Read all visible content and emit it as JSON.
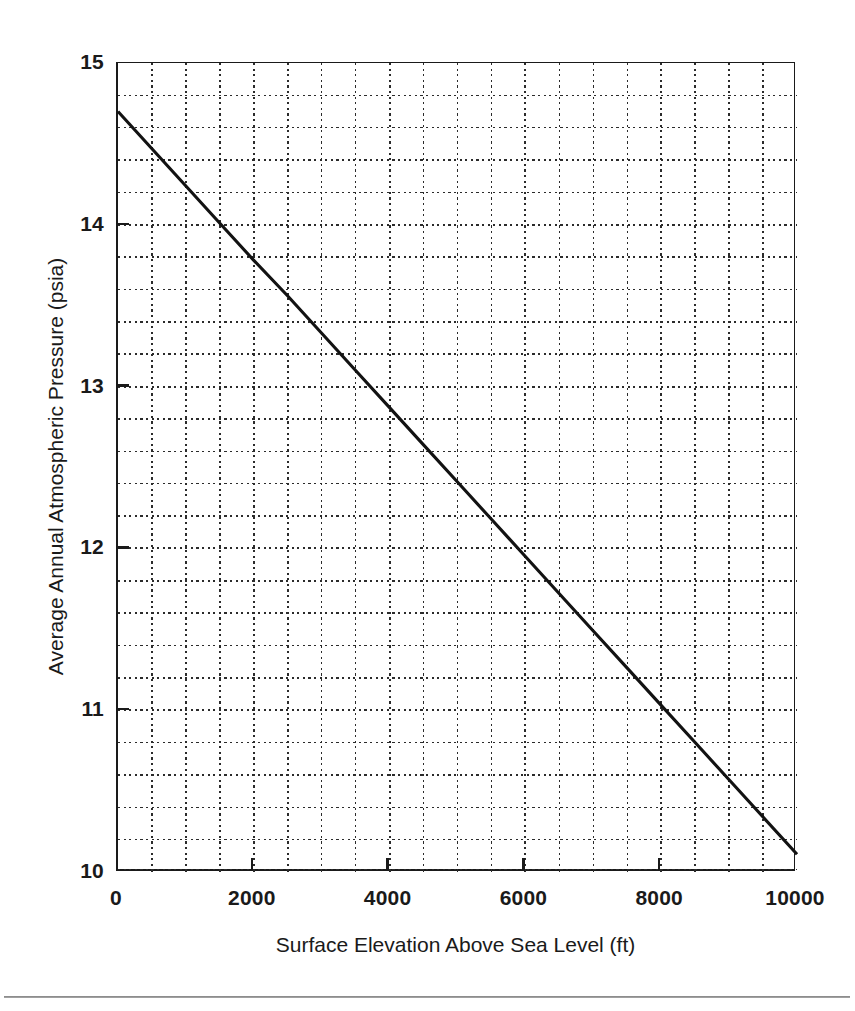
{
  "chart_data": {
    "type": "line",
    "title": "",
    "subtitle": "",
    "xlabel": "Surface Elevation Above Sea Level (ft)",
    "ylabel": "Average Annual Atmospheric Pressure (psia)",
    "xlim": [
      0,
      10000
    ],
    "ylim": [
      10,
      15
    ],
    "x_major_tick_labels": [
      "0",
      "2000",
      "4000",
      "6000",
      "8000",
      "10000"
    ],
    "x_major_ticks": [
      0,
      2000,
      4000,
      6000,
      8000,
      10000
    ],
    "x_minor_ticks": [
      500,
      1000,
      1500,
      2500,
      3000,
      3500,
      4500,
      5000,
      5500,
      6500,
      7000,
      7500,
      8500,
      9000,
      9500
    ],
    "x_grid_step": 500,
    "y_major_tick_labels": [
      "10",
      "11",
      "12",
      "13",
      "14",
      "15"
    ],
    "y_major_ticks": [
      10,
      11,
      12,
      13,
      14,
      15
    ],
    "y_grid_step": 0.2,
    "grid": "dotted-both",
    "legend": "none",
    "series": [
      {
        "name": "Average annual atmospheric pressure",
        "x": [
          0,
          500,
          1000,
          1500,
          2000,
          2500,
          3000,
          3500,
          4000,
          4500,
          5000,
          5500,
          6000,
          6500,
          7000,
          7500,
          8000,
          8500,
          9000,
          9500,
          10000
        ],
        "values": [
          14.7,
          14.47,
          14.24,
          14.01,
          13.78,
          13.56,
          13.33,
          13.1,
          12.87,
          12.64,
          12.41,
          12.18,
          11.95,
          11.72,
          11.49,
          11.26,
          11.03,
          10.8,
          10.57,
          10.34,
          10.11
        ]
      }
    ],
    "annotations": []
  },
  "axes": {
    "x_tick_labels": [
      "0",
      "2000",
      "4000",
      "6000",
      "8000",
      "10000"
    ],
    "y_tick_labels": [
      "10",
      "11",
      "12",
      "13",
      "14",
      "15"
    ]
  },
  "figure": {
    "xlabel": "Surface Elevation Above Sea Level (ft)",
    "ylabel": "Average Annual Atmospheric Pressure (psia)"
  }
}
